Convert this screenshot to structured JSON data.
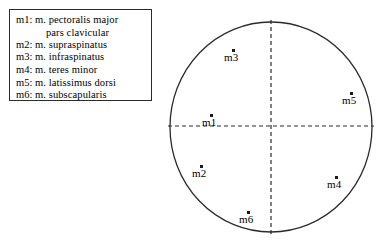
{
  "figure": {
    "width": 386,
    "height": 245,
    "background_color": "#ffffff",
    "line_color": "#2b2b2b",
    "marker_color": "#1a1a1a"
  },
  "legend": {
    "entries": [
      {
        "key": "m1:",
        "text": "m. pectoralis major",
        "continuation": "pars clavicular"
      },
      {
        "key": "m2:",
        "text": "m. supraspinatus",
        "continuation": ""
      },
      {
        "key": "m3:",
        "text": "m. infraspinatus",
        "continuation": ""
      },
      {
        "key": "m4:",
        "text": "m. teres minor",
        "continuation": ""
      },
      {
        "key": "m5:",
        "text": "m. latissimus dorsi",
        "continuation": ""
      },
      {
        "key": "m6:",
        "text": "m. subscapularis",
        "continuation": ""
      }
    ]
  },
  "diagram": {
    "circle": {
      "cx": 111,
      "cy": 127,
      "rx": 101,
      "ry": 105
    },
    "axes": {
      "horizontal": {
        "y": 126,
        "x1": 8,
        "x2": 214
      },
      "vertical": {
        "x": 111,
        "y1": 20,
        "y2": 234
      },
      "dash_pattern": "4 3"
    },
    "points": [
      {
        "id": "m3",
        "label": "m3",
        "x": 73,
        "y": 50
      },
      {
        "id": "m5",
        "label": "m5",
        "x": 191,
        "y": 93
      },
      {
        "id": "m1",
        "label": "m1",
        "x": 51,
        "y": 115
      },
      {
        "id": "m2",
        "label": "m2",
        "x": 41,
        "y": 166
      },
      {
        "id": "m4",
        "label": "m4",
        "x": 176,
        "y": 177
      },
      {
        "id": "m6",
        "label": "m6",
        "x": 88,
        "y": 212
      }
    ]
  }
}
